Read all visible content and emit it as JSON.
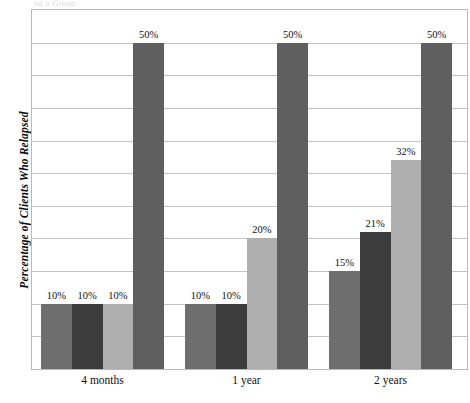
{
  "top_sliver_text": "ng a Group",
  "chart_data": {
    "type": "bar",
    "title": "",
    "xlabel": "",
    "ylabel": "Percentage of Clients Who Relapsed",
    "ylim": [
      0,
      55
    ],
    "grid": true,
    "grid_step": 5,
    "legend": "none",
    "value_suffix": "%",
    "categories": [
      "4 months",
      "1 year",
      "2 years"
    ],
    "series": [
      {
        "name": "Series 1",
        "color": "#6E6E6E",
        "values": [
          10,
          10,
          15
        ],
        "labels": [
          "10%",
          "10%",
          "15%"
        ]
      },
      {
        "name": "Series 2",
        "color": "#3C3C3C",
        "values": [
          10,
          10,
          21
        ],
        "labels": [
          "10%",
          "10%",
          "21%"
        ]
      },
      {
        "name": "Series 3",
        "color": "#AFAFAF",
        "values": [
          10,
          20,
          32
        ],
        "labels": [
          "10%",
          "20%",
          "32%"
        ]
      },
      {
        "name": "Series 4",
        "color": "#5F5F5F",
        "values": [
          50,
          50,
          50
        ],
        "labels": [
          "50%",
          "50%",
          "50%"
        ]
      }
    ]
  }
}
